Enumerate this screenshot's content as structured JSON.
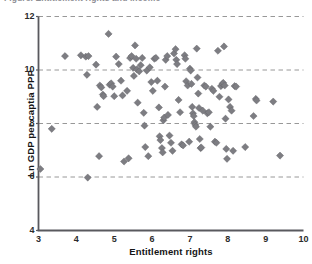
{
  "figure": {
    "clipped_title": "Figure. Entitlement rights and income"
  },
  "chart_data": {
    "type": "scatter",
    "title": "",
    "xlabel": "Entitlement rights",
    "ylabel": "Ln GDP per captia PPP",
    "xlim": [
      3,
      10
    ],
    "ylim": [
      4,
      12
    ],
    "xticks": [
      3,
      4,
      5,
      6,
      7,
      8,
      9,
      10
    ],
    "xtick_labels": [
      "3",
      "4",
      "5",
      "6",
      "7",
      "8",
      "9",
      "10"
    ],
    "yticks": [
      4,
      6,
      8,
      10,
      12
    ],
    "ytick_labels": [
      "4",
      "6",
      "8",
      "10",
      "12"
    ],
    "grid": {
      "enabled": true,
      "axis": "y",
      "values": [
        6,
        8,
        10,
        12
      ],
      "style": "dashed",
      "color": "#8c8c8c"
    },
    "legend": {
      "visible": false,
      "position": "none"
    },
    "marker": {
      "shape": "diamond",
      "size": 3.6,
      "color": "#7d7d82",
      "edge_color": "#5f5f64"
    },
    "axis_color": "#59595e",
    "series": [
      {
        "name": "Countries",
        "n": 131,
        "points": [
          [
            3.05,
            6.3
          ],
          [
            3.35,
            7.8
          ],
          [
            3.7,
            10.52
          ],
          [
            4.12,
            10.55
          ],
          [
            4.25,
            10.5
          ],
          [
            4.32,
            10.52
          ],
          [
            4.28,
            9.82
          ],
          [
            4.3,
            5.98
          ],
          [
            4.52,
            10.2
          ],
          [
            4.55,
            8.62
          ],
          [
            4.6,
            6.78
          ],
          [
            4.62,
            9.42
          ],
          [
            4.66,
            9.35
          ],
          [
            4.7,
            9.08
          ],
          [
            4.72,
            9.02
          ],
          [
            4.85,
            11.35
          ],
          [
            4.88,
            9.45
          ],
          [
            4.92,
            9.5
          ],
          [
            4.96,
            9.38
          ],
          [
            5.0,
            9.02
          ],
          [
            5.05,
            10.5
          ],
          [
            5.12,
            10.22
          ],
          [
            5.18,
            9.6
          ],
          [
            5.22,
            9.05
          ],
          [
            5.26,
            6.58
          ],
          [
            5.34,
            9.22
          ],
          [
            5.38,
            6.7
          ],
          [
            5.42,
            10.45
          ],
          [
            5.46,
            10.52
          ],
          [
            5.5,
            10.08
          ],
          [
            5.52,
            9.78
          ],
          [
            5.55,
            10.92
          ],
          [
            5.58,
            10.42
          ],
          [
            5.6,
            10.02
          ],
          [
            5.62,
            8.78
          ],
          [
            5.66,
            9.95
          ],
          [
            5.7,
            10.18
          ],
          [
            5.74,
            10.45
          ],
          [
            5.78,
            8.4
          ],
          [
            5.8,
            7.92
          ],
          [
            5.82,
            7.12
          ],
          [
            5.86,
            9.98
          ],
          [
            5.9,
            6.78
          ],
          [
            5.94,
            10.1
          ],
          [
            5.98,
            9.55
          ],
          [
            6.02,
            9.22
          ],
          [
            6.06,
            10.42
          ],
          [
            6.1,
            10.45
          ],
          [
            6.14,
            9.6
          ],
          [
            6.18,
            8.6
          ],
          [
            6.2,
            7.52
          ],
          [
            6.22,
            7.38
          ],
          [
            6.26,
            7.08
          ],
          [
            6.28,
            6.92
          ],
          [
            6.3,
            8.12
          ],
          [
            6.32,
            8.22
          ],
          [
            6.34,
            9.38
          ],
          [
            6.36,
            10.38
          ],
          [
            6.4,
            10.52
          ],
          [
            6.42,
            8.32
          ],
          [
            6.46,
            7.55
          ],
          [
            6.5,
            7.28
          ],
          [
            6.54,
            6.98
          ],
          [
            6.58,
            10.62
          ],
          [
            6.62,
            10.78
          ],
          [
            6.64,
            10.38
          ],
          [
            6.66,
            10.22
          ],
          [
            6.7,
            8.88
          ],
          [
            6.74,
            8.42
          ],
          [
            6.78,
            7.22
          ],
          [
            6.82,
            7.18
          ],
          [
            6.86,
            10.55
          ],
          [
            6.88,
            10.42
          ],
          [
            6.9,
            9.58
          ],
          [
            6.94,
            9.42
          ],
          [
            6.98,
            7.32
          ],
          [
            7.0,
            10.05
          ],
          [
            7.02,
            9.98
          ],
          [
            7.04,
            9.48
          ],
          [
            7.06,
            8.62
          ],
          [
            7.08,
            8.38
          ],
          [
            7.1,
            8.28
          ],
          [
            7.12,
            8.05
          ],
          [
            7.14,
            7.95
          ],
          [
            7.16,
            7.88
          ],
          [
            7.18,
            10.8
          ],
          [
            7.2,
            9.72
          ],
          [
            7.22,
            9.12
          ],
          [
            7.24,
            8.58
          ],
          [
            7.26,
            7.42
          ],
          [
            7.28,
            7.08
          ],
          [
            7.3,
            7.1
          ],
          [
            7.34,
            8.48
          ],
          [
            7.38,
            9.42
          ],
          [
            7.42,
            9.38
          ],
          [
            7.46,
            8.38
          ],
          [
            7.5,
            8.42
          ],
          [
            7.54,
            7.88
          ],
          [
            7.58,
            9.3
          ],
          [
            7.62,
            9.22
          ],
          [
            7.66,
            7.32
          ],
          [
            7.7,
            7.28
          ],
          [
            7.74,
            10.72
          ],
          [
            7.78,
            9.0
          ],
          [
            7.82,
            9.4
          ],
          [
            7.86,
            9.48
          ],
          [
            7.88,
            9.52
          ],
          [
            7.9,
            10.88
          ],
          [
            7.92,
            9.42
          ],
          [
            7.94,
            8.18
          ],
          [
            7.96,
            7.05
          ],
          [
            7.98,
            6.68
          ],
          [
            8.02,
            8.9
          ],
          [
            8.06,
            8.62
          ],
          [
            8.1,
            8.48
          ],
          [
            8.14,
            6.98
          ],
          [
            8.18,
            9.4
          ],
          [
            8.22,
            9.38
          ],
          [
            8.46,
            7.12
          ],
          [
            8.68,
            8.28
          ],
          [
            8.74,
            8.92
          ],
          [
            8.76,
            8.86
          ],
          [
            9.2,
            8.82
          ],
          [
            9.38,
            6.8
          ]
        ]
      }
    ]
  }
}
